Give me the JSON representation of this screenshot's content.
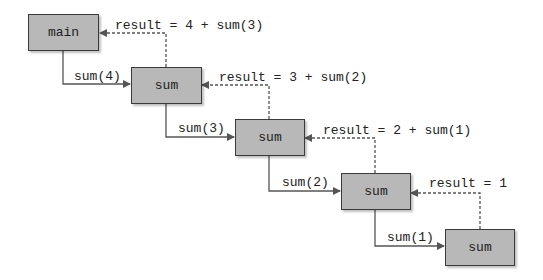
{
  "diagram": {
    "type": "recursion-call-trace",
    "nodes": [
      {
        "id": "main",
        "label": "main"
      },
      {
        "id": "sum4",
        "label": "sum"
      },
      {
        "id": "sum3",
        "label": "sum"
      },
      {
        "id": "sum2",
        "label": "sum"
      },
      {
        "id": "sum1",
        "label": "sum"
      }
    ],
    "calls": [
      {
        "from": "main",
        "to": "sum4",
        "label": "sum(4)"
      },
      {
        "from": "sum4",
        "to": "sum3",
        "label": "sum(3)"
      },
      {
        "from": "sum3",
        "to": "sum2",
        "label": "sum(2)"
      },
      {
        "from": "sum2",
        "to": "sum1",
        "label": "sum(1)"
      }
    ],
    "returns": [
      {
        "from": "sum4",
        "to": "main",
        "label": "result = 4 + sum(3)"
      },
      {
        "from": "sum3",
        "to": "sum4",
        "label": "result = 3 + sum(2)"
      },
      {
        "from": "sum2",
        "to": "sum3",
        "label": "result = 2 + sum(1)"
      },
      {
        "from": "sum1",
        "to": "sum2",
        "label": "result = 1"
      }
    ],
    "colors": {
      "box_fill": "#b8b8b8",
      "box_border": "#3a3a3a",
      "line": "#555555"
    }
  }
}
